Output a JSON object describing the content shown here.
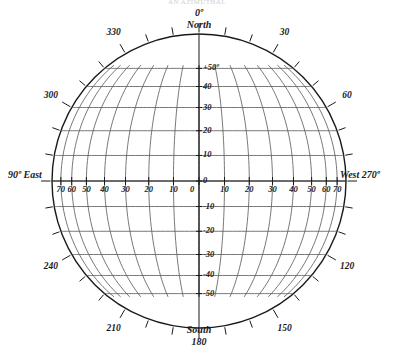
{
  "figure": {
    "title_partial": "AN AZIMUTHAL",
    "background_color": "#ffffff",
    "ink_color": "#1a1a1a",
    "grid_color": "#555555"
  },
  "geometry": {
    "center_x": 199,
    "center_y": 181,
    "radius": 147,
    "tick_length": 9
  },
  "cardinals": {
    "north_degree": "0º",
    "north_name": "North",
    "south_name": "South",
    "south_degree": "180",
    "east_label": "90º East",
    "west_label": "West 270º"
  },
  "bearing_ring": {
    "labels": [
      {
        "text": "30",
        "deg": 30
      },
      {
        "text": "60",
        "deg": 60
      },
      {
        "text": "120",
        "deg": 120
      },
      {
        "text": "150",
        "deg": 150
      },
      {
        "text": "210",
        "deg": 210
      },
      {
        "text": "240",
        "deg": 240
      },
      {
        "text": "300",
        "deg": 300
      },
      {
        "text": "330",
        "deg": 330
      }
    ],
    "tick_interval_deg": 10
  },
  "chart_data": {
    "type": "scatter",
    "title": "AN AZIMUTHAL",
    "xlabel": "Longitude",
    "ylabel": "Latitude",
    "projection": "orthographic-globe",
    "grid": true,
    "legend": "none",
    "xlim": [
      -90,
      90
    ],
    "ylim": [
      -90,
      90
    ],
    "latitude_lines": {
      "values": [
        50,
        40,
        30,
        20,
        10,
        0,
        -10,
        -20,
        -30,
        -40,
        -50
      ],
      "labels": [
        "+50º",
        "40",
        "30",
        "20",
        "10",
        "0",
        "-10",
        "-20",
        "-30",
        "-40",
        "-50"
      ],
      "interval": 10
    },
    "meridian_lines": {
      "values": [
        -70,
        -60,
        -50,
        -40,
        -30,
        -20,
        -10,
        0,
        10,
        20,
        30,
        40,
        50,
        60,
        70
      ],
      "east_labels": [
        "70",
        "60",
        "50",
        "40",
        "30",
        "20",
        "10"
      ],
      "center_label": "0",
      "west_labels": [
        "10",
        "20",
        "30",
        "40",
        "50",
        "60",
        "70"
      ],
      "interval": 10
    },
    "equator_tick_labels": [
      "70",
      "60",
      "50",
      "40",
      "30",
      "20",
      "10",
      "0",
      "10",
      "20",
      "30",
      "40",
      "50",
      "60",
      "70"
    ],
    "meridian_tick_labels": [
      "+50º",
      "40",
      "30",
      "20",
      "10",
      "0",
      "-10",
      "-20",
      "-30",
      "-40",
      "-50"
    ]
  }
}
